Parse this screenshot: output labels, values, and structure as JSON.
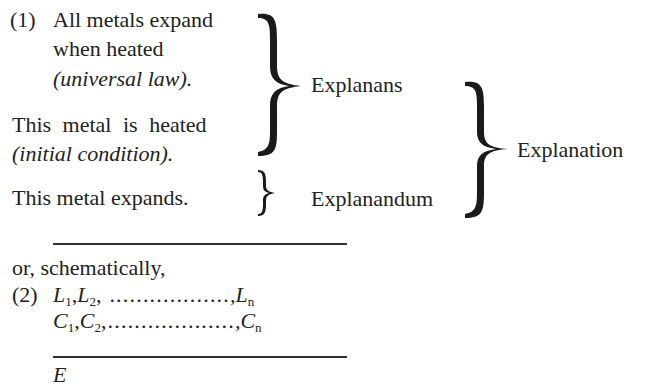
{
  "example1": {
    "number": "(1)",
    "law_line1": "All metals expand",
    "law_line2": "when heated",
    "law_note": "(universal law).",
    "condition": "This metal is heated",
    "condition_note": "(initial condition).",
    "conclusion": "This metal expands.",
    "explanans_label": "Explanans",
    "explanandum_label": "Explanandum",
    "explanation_label": "Explanation"
  },
  "transition": "or, schematically,",
  "example2": {
    "number": "(2)",
    "laws": {
      "a": "L",
      "a_sub": "1",
      "b": "L",
      "b_sub": "2",
      "dots": ", ..................",
      "n": ",L",
      "n_sub": "n"
    },
    "conditions": {
      "a": "C",
      "a_sub": "1",
      "b": "C",
      "b_sub": "2",
      "dots": ",...................",
      "n": ",C",
      "n_sub": "n"
    },
    "explanandum": "E"
  }
}
